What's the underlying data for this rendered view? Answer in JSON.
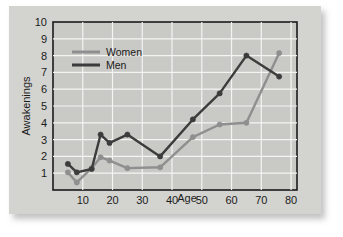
{
  "chart_data": {
    "type": "line",
    "title": "",
    "xlabel": "Age",
    "ylabel": "Awakenings",
    "xlim": [
      0,
      82
    ],
    "ylim": [
      0,
      10
    ],
    "xticks": [
      10,
      20,
      30,
      40,
      50,
      60,
      70,
      80
    ],
    "yticks": [
      1,
      2,
      3,
      4,
      5,
      6,
      7,
      8,
      9,
      10
    ],
    "grid": true,
    "legend_position": "top-left",
    "series": [
      {
        "name": "Women",
        "color": "#8f8f8f",
        "x": [
          5,
          8,
          13,
          16,
          19,
          25,
          36,
          47,
          56,
          65,
          76
        ],
        "values": [
          1.05,
          0.45,
          1.3,
          1.95,
          1.75,
          1.3,
          1.35,
          3.15,
          3.9,
          4.0,
          8.15
        ]
      },
      {
        "name": "Men",
        "color": "#3c3c3c",
        "x": [
          5,
          8,
          13,
          16,
          19,
          25,
          36,
          47,
          56,
          65,
          76
        ],
        "values": [
          1.55,
          1.05,
          1.25,
          3.3,
          2.8,
          3.3,
          2.0,
          4.2,
          5.75,
          8.0,
          6.75
        ]
      }
    ]
  },
  "legend": {
    "entries": [
      {
        "label": "Women"
      },
      {
        "label": "Men"
      }
    ]
  },
  "axes": {
    "x_title": "Age",
    "y_title": "Awakenings",
    "x_tick_labels": [
      "10",
      "20",
      "30",
      "40",
      "50",
      "60",
      "70",
      "80"
    ],
    "y_tick_labels": [
      "1",
      "2",
      "3",
      "4",
      "5",
      "6",
      "7",
      "8",
      "9",
      "10"
    ]
  }
}
